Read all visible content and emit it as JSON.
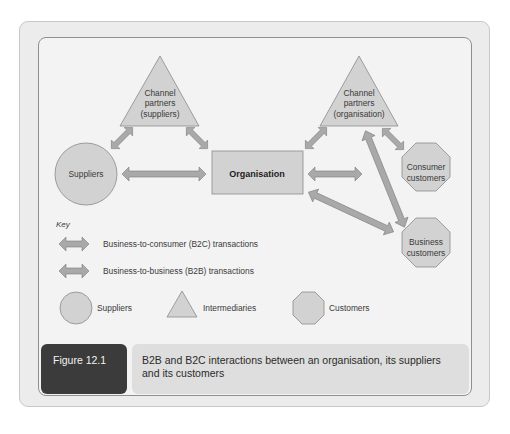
{
  "diagram": {
    "nodes": {
      "suppliers": {
        "label": "Suppliers",
        "shape": "circle"
      },
      "channel_suppliers": {
        "line1": "Channel",
        "line2": "partners",
        "line3": "(suppliers)",
        "shape": "triangle"
      },
      "organisation": {
        "label": "Organisation",
        "shape": "rectangle"
      },
      "channel_organisation": {
        "line1": "Channel",
        "line2": "partners",
        "line3": "(organisation)",
        "shape": "triangle"
      },
      "consumer_customers": {
        "line1": "Consumer",
        "line2": "customers",
        "shape": "octagon"
      },
      "business_customers": {
        "line1": "Business",
        "line2": "customers",
        "shape": "octagon"
      }
    },
    "edges": [
      {
        "from": "suppliers",
        "to": "channel_suppliers"
      },
      {
        "from": "channel_suppliers",
        "to": "organisation"
      },
      {
        "from": "suppliers",
        "to": "organisation"
      },
      {
        "from": "organisation",
        "to": "channel_organisation"
      },
      {
        "from": "channel_organisation",
        "to": "consumer_customers"
      },
      {
        "from": "organisation",
        "to": "consumer_customers"
      },
      {
        "from": "channel_organisation",
        "to": "business_customers"
      },
      {
        "from": "organisation",
        "to": "business_customers"
      }
    ],
    "key": {
      "title": "Key",
      "b2c": "Business-to-consumer (B2C) transactions",
      "b2b": "Business-to-business (B2B) transactions",
      "suppliers": "Suppliers",
      "intermediaries": "Intermediaries",
      "customers": "Customers"
    }
  },
  "caption": {
    "figure_label": "Figure 12.1",
    "text": "B2B and B2C interactions between an organisation, its suppliers and its customers"
  },
  "colors": {
    "shape_fill": "#d2d2d2",
    "shape_stroke": "#8a8a8a",
    "arrow_fill": "#a9a9a9",
    "panel_bg": "#f3f3f3",
    "figure_tag_bg": "#3b3b3b",
    "caption_bg": "#dedede"
  }
}
